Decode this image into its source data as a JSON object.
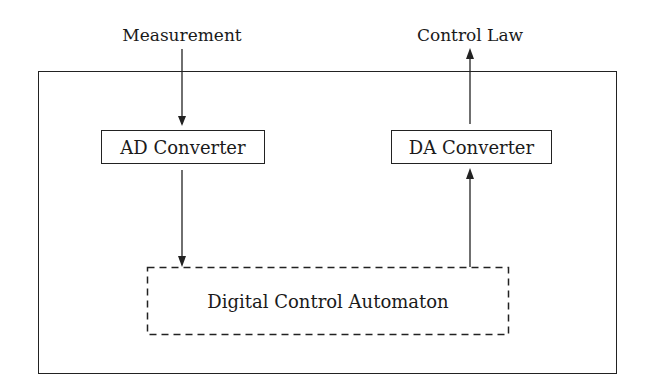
{
  "diagram": {
    "inputs": {
      "measurement": "Measurement"
    },
    "outputs": {
      "control_law": "Control Law"
    },
    "blocks": {
      "ad_converter": "AD Converter",
      "da_converter": "DA Converter",
      "automaton": "Digital Control Automaton"
    },
    "edges": [
      {
        "from": "Measurement",
        "to": "AD Converter"
      },
      {
        "from": "AD Converter",
        "to": "Digital Control Automaton"
      },
      {
        "from": "Digital Control Automaton",
        "to": "DA Converter"
      },
      {
        "from": "DA Converter",
        "to": "Control Law"
      }
    ],
    "colors": {
      "stroke": "#222222",
      "background": "#ffffff"
    }
  }
}
